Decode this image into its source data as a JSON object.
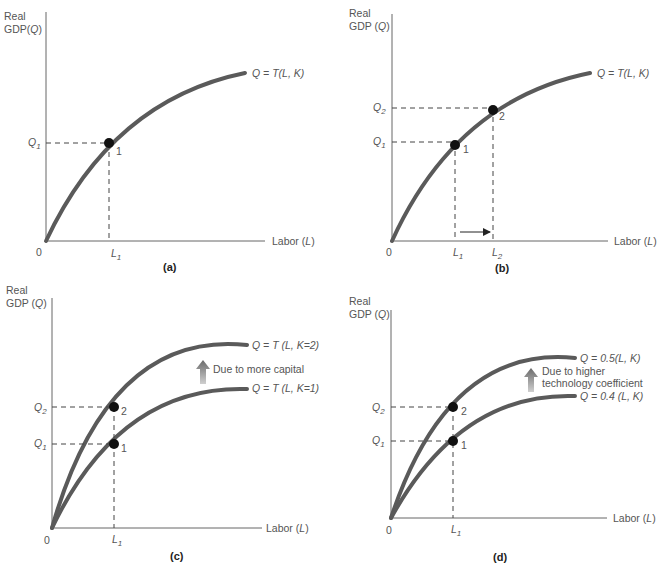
{
  "panels": {
    "a": {
      "caption": "(a)",
      "y_label_1": "Real",
      "y_label_2": "GDP(Q)",
      "x_label": "Labor (L)",
      "origin": "0",
      "curve_label": "Q = T(L, K)",
      "q1": "Q1",
      "l1": "L1",
      "point1": "1"
    },
    "b": {
      "caption": "(b)",
      "y_label_1": "Real",
      "y_label_2": "GDP(Q)",
      "x_label": "Labor (L)",
      "origin": "0",
      "curve_label": "Q = T(L, K)",
      "q1": "Q1",
      "q2": "Q2",
      "l1": "L1",
      "l2": "L2",
      "point1": "1",
      "point2": "2"
    },
    "c": {
      "caption": "(c)",
      "y_label_1": "Real",
      "y_label_2": "GDP (Q)",
      "x_label": "Labor (L)",
      "origin": "0",
      "curve_top_label": "Q = T (L, K=2)",
      "curve_bottom_label": "Q = T (L, K=1)",
      "shift_note": "Due to more capital",
      "q1": "Q1",
      "q2": "Q2",
      "l1": "L1",
      "point1": "1",
      "point2": "2"
    },
    "d": {
      "caption": "(d)",
      "y_label_1": "Real",
      "y_label_2": "GDP(Q)",
      "x_label": "Labor (L)",
      "origin": "0",
      "curve_top_label": "Q = 0.5(L, K)",
      "curve_bottom_label": "Q = 0.4 (L, K)",
      "shift_note_1": "Due to higher",
      "shift_note_2": "technology coefficient",
      "q1": "Q1",
      "q2": "Q2",
      "l1": "L1",
      "point1": "1",
      "point2": "2"
    }
  },
  "colors": {
    "curve": "#5a5a5a",
    "point": "#111111",
    "axis": "#666666"
  }
}
